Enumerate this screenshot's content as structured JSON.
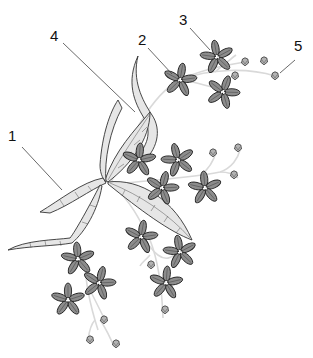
{
  "diagram": {
    "type": "embroidery-motif-illustration",
    "colors": {
      "background": "#ffffff",
      "outline": "#333333",
      "leaf_fill": "#e6e6e6",
      "petal_fill": "#8c8c8c",
      "stem": "#d9d9d9",
      "bud_fill": "#b3b3b3",
      "leader_line": "#444444"
    },
    "callouts": [
      {
        "id": "1",
        "label": "1",
        "x": 13,
        "y": 135,
        "target": "leaf"
      },
      {
        "id": "2",
        "label": "2",
        "x": 140,
        "y": 41,
        "target": "flower"
      },
      {
        "id": "3",
        "label": "3",
        "x": 181,
        "y": 19,
        "target": "flower"
      },
      {
        "id": "4",
        "label": "4",
        "x": 52,
        "y": 32,
        "target": "leaf-stem"
      },
      {
        "id": "5",
        "label": "5",
        "x": 296,
        "y": 50,
        "target": "bud"
      }
    ]
  }
}
